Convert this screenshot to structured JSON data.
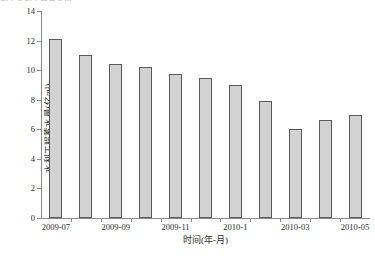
{
  "figure": {
    "top_cut_caption": "图 1  水利工程蓄水量",
    "background": "#ffffff",
    "bar_fill": "#d2d2d2",
    "bar_stroke": "#5a5a5a",
    "axis_color": "#8c8c8c"
  },
  "chart_data": {
    "type": "bar",
    "title": "",
    "xlabel": "时间(年-月)",
    "ylabel": "水利工程蓄水量(亿m³)",
    "ylim": [
      0,
      14
    ],
    "ytick_values": [
      0,
      2,
      4,
      6,
      8,
      10,
      12,
      14
    ],
    "ytick_labels": [
      "0",
      "2",
      "4",
      "6",
      "8",
      "10",
      "12",
      "14"
    ],
    "grid": false,
    "legend": null,
    "categories": [
      "2009-07",
      "2009-08",
      "2009-09",
      "2009-10",
      "2009-11",
      "2009-12",
      "2010-1",
      "2010-02",
      "2010-03",
      "2010-04",
      "2010-05"
    ],
    "xtick_labels": [
      "2009-07",
      "2009-09",
      "2009-11",
      "2010-1",
      "2010-03",
      "2010-05"
    ],
    "xtick_category_index": [
      0,
      2,
      4,
      6,
      8,
      10
    ],
    "values": [
      12.1,
      11.0,
      10.4,
      10.2,
      9.75,
      9.5,
      9.0,
      7.9,
      6.0,
      6.65,
      7.0
    ]
  }
}
